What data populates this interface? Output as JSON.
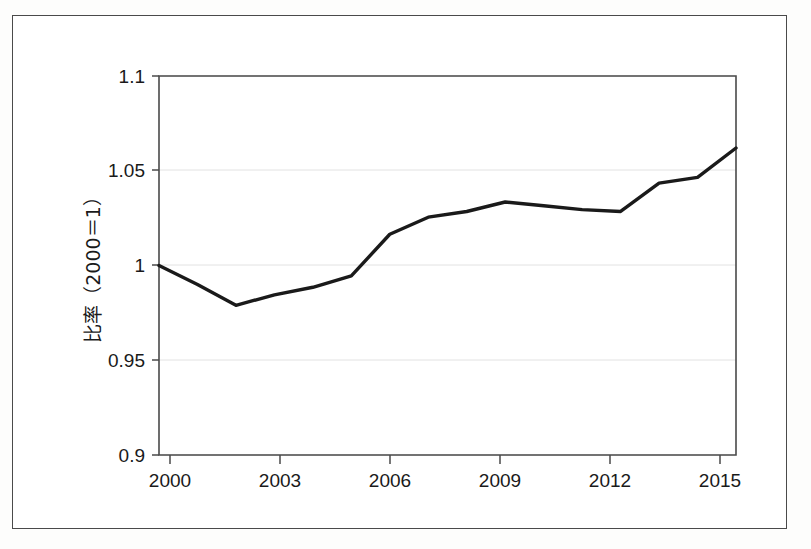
{
  "chart_data": {
    "type": "line",
    "title": "",
    "xlabel": "",
    "ylabel": "比率（2000＝1）",
    "x": [
      2000,
      2001,
      2002,
      2003,
      2004,
      2005,
      2006,
      2007,
      2008,
      2009,
      2010,
      2011,
      2012,
      2013,
      2014,
      2015
    ],
    "values": [
      1.0,
      0.99,
      0.979,
      0.9845,
      0.9885,
      0.9945,
      1.0165,
      1.0255,
      1.0285,
      1.0335,
      1.0315,
      1.0295,
      1.0285,
      1.0435,
      1.0465,
      1.062
    ],
    "series": [
      {
        "name": "比率（2000＝1）",
        "values": [
          1.0,
          0.99,
          0.979,
          0.9845,
          0.9885,
          0.9945,
          1.0165,
          1.0255,
          1.0285,
          1.0335,
          1.0315,
          1.0295,
          1.0285,
          1.0435,
          1.0465,
          1.062
        ],
        "color": "#1a1a1a"
      }
    ],
    "xlim": [
      2000,
      2015
    ],
    "ylim": [
      0.9,
      1.1
    ],
    "yticks": [
      0.9,
      0.95,
      1,
      1.05,
      1.1
    ],
    "ytick_labels": [
      "0.9",
      "0.95",
      "1",
      "1.05",
      "1.1"
    ],
    "xticks": [
      2000,
      2003,
      2006,
      2009,
      2012,
      2015
    ],
    "xtick_labels": [
      "2000",
      "2003",
      "2006",
      "2009",
      "2012",
      "2015"
    ],
    "grid": "horizontal",
    "legend": "none",
    "line_color": "#1a1a1a",
    "line_width": 3.4,
    "grid_color": "#e2e2e2",
    "axis_color": "#4a4a4a",
    "background": "#ffffff"
  },
  "axis_labels": {
    "y_title": "比率（2000＝1）",
    "y_tick_0": "0.9",
    "y_tick_1": "0.95",
    "y_tick_2": "1",
    "y_tick_3": "1.05",
    "y_tick_4": "1.1",
    "x_tick_0": "2000",
    "x_tick_1": "2003",
    "x_tick_2": "2006",
    "x_tick_3": "2009",
    "x_tick_4": "2012",
    "x_tick_5": "2015"
  }
}
